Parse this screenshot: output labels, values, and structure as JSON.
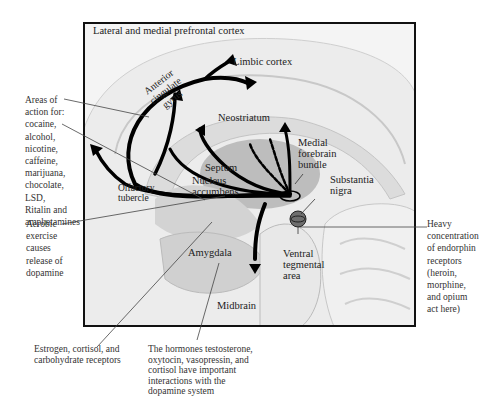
{
  "diagram": {
    "inside_labels": {
      "prefrontal": "Lateral and medial prefrontal cortex",
      "limbic": "Limbic cortex",
      "anterior_cingulate": [
        "Anterior",
        "cingulate",
        "gyrus"
      ],
      "neostriatum": "Neostriatum",
      "septum": "Septum",
      "nucleus_accumbens": [
        "Nucleus",
        "accumbens"
      ],
      "olfactory": [
        "Olfactory",
        "tubercle"
      ],
      "medial_forebrain": [
        "Medial",
        "forebrain",
        "bundle"
      ],
      "substantia_nigra": [
        "Substantia",
        "nigra"
      ],
      "ventral_tegmental": [
        "Ventral",
        "tegmental",
        "area"
      ],
      "amygdala": "Amygdala",
      "midbrain": "Midbrain"
    },
    "callouts": {
      "areas_of_action": [
        "Areas of",
        "action for:",
        "cocaine,",
        "alcohol,",
        "nicotine,",
        "caffeine,",
        "marijuana,",
        "chocolate,",
        "LSD,",
        "Ritalin and",
        "amphetamines"
      ],
      "aerobic": [
        "Aerobic",
        "exercise",
        "causes",
        "release of",
        "dopamine"
      ],
      "endorphin": [
        "Heavy",
        "concentration",
        "of endorphin",
        "receptors",
        "(heroin,",
        "morphine,",
        "and  opium",
        "act here)"
      ],
      "estrogen": [
        "Estrogen, cortisol, and",
        "carbohydrate receptors"
      ],
      "hormones": [
        "The hormones testosterone,",
        "oxytocin, vasopressin, and",
        "cortisol have important",
        "interactions with the",
        "dopamine system"
      ]
    },
    "colors": {
      "frame": "#111111",
      "brain_fill": "#e6e6e6",
      "dark_region": "#bdbdbd",
      "arrow": "#000000",
      "vta": "#6e6e6e"
    }
  }
}
